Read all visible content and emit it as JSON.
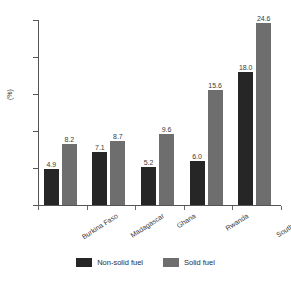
{
  "chart_data": {
    "type": "bar",
    "title": "",
    "subtitle": "",
    "xlabel": "",
    "ylabel": "(%)",
    "ylim": [
      0,
      25
    ],
    "ytick_labels": [
      "0",
      "5",
      "10",
      "15",
      "20",
      "25"
    ],
    "ytick_values": [
      0,
      5,
      10,
      15,
      20,
      25
    ],
    "grid": false,
    "legend_position": "bottom-center",
    "categories": [
      "Burkina Faso",
      "Madagascar",
      "Ghana",
      "Rwanda",
      "South Africa"
    ],
    "series": [
      {
        "name": "Non-solid fuel",
        "color": "#262626",
        "values": [
          4.9,
          7.1,
          5.2,
          6.0,
          18.0
        ],
        "labels": [
          "4.9",
          "7.1",
          "5.2",
          "6.0",
          "18.0"
        ]
      },
      {
        "name": "Solid fuel",
        "color": "#6e6e6e",
        "values": [
          8.2,
          8.7,
          9.6,
          15.6,
          24.6
        ],
        "labels": [
          "8.2",
          "8.7",
          "9.6",
          "15.6",
          "24.6"
        ]
      }
    ]
  },
  "legend": {
    "items": [
      {
        "label": "Non-solid fuel",
        "color": "#262626"
      },
      {
        "label": "Solid fuel",
        "color": "#6e6e6e"
      }
    ]
  },
  "colors": {
    "axis": "#555555",
    "text": "#3a3a3a",
    "background": "#ffffff",
    "series_non_solid": "#262626",
    "series_solid": "#6e6e6e"
  }
}
